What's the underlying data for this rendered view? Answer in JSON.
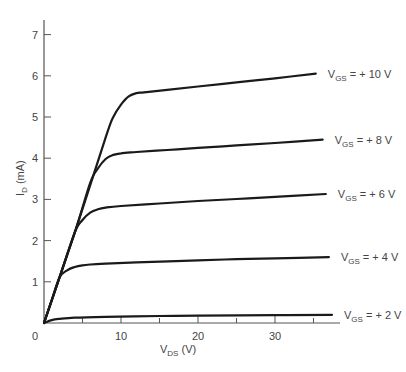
{
  "chart_data": {
    "type": "line",
    "title": "",
    "xlabel": "V_DS (V)",
    "xlabel_main": "V",
    "xlabel_sub": "DS",
    "xlabel_unit": "(V)",
    "ylabel": "I_D (mA)",
    "ylabel_main": "I",
    "ylabel_sub": "D",
    "ylabel_unit": "(mA)",
    "xlim": [
      0,
      42
    ],
    "ylim": [
      0,
      7.3
    ],
    "grid": false,
    "legend_position": "inline-right",
    "x_ticks_major": [
      10,
      20,
      30
    ],
    "x_ticks_minor": [
      5,
      15,
      25,
      35
    ],
    "x_tick_labels": [
      "0",
      "10",
      "20",
      "30"
    ],
    "y_ticks": [
      1,
      2,
      3,
      4,
      5,
      6,
      7
    ],
    "y_tick_labels": [
      "1",
      "2",
      "3",
      "4",
      "5",
      "6",
      "7"
    ],
    "origin_label": "0",
    "series": [
      {
        "name": "V_GS = + 10 V",
        "label_main": "V",
        "label_sub": "GS",
        "label_rest": " = + 10 V",
        "x": [
          0,
          4,
          8,
          9,
          10,
          11,
          12,
          13,
          16,
          20,
          25,
          30,
          35.3
        ],
        "y": [
          0,
          2.2,
          4.5,
          5.0,
          5.3,
          5.5,
          5.58,
          5.6,
          5.66,
          5.74,
          5.84,
          5.94,
          6.05
        ]
      },
      {
        "name": "V_GS = + 8 V",
        "label_main": "V",
        "label_sub": "GS",
        "label_rest": " = + 8 V",
        "x": [
          0,
          4,
          6,
          7,
          8,
          9,
          10,
          12,
          16,
          20,
          25,
          30,
          36.2
        ],
        "y": [
          0,
          2.2,
          3.4,
          3.75,
          3.98,
          4.08,
          4.12,
          4.15,
          4.2,
          4.25,
          4.31,
          4.37,
          4.45
        ]
      },
      {
        "name": "V_GS = + 6 V",
        "label_main": "V",
        "label_sub": "GS",
        "label_rest": " = + 6 V",
        "x": [
          0,
          2,
          4,
          5,
          6,
          7,
          8,
          10,
          15,
          20,
          25,
          30,
          36.6
        ],
        "y": [
          0,
          1.1,
          2.2,
          2.5,
          2.68,
          2.76,
          2.8,
          2.84,
          2.9,
          2.96,
          3.01,
          3.06,
          3.13
        ]
      },
      {
        "name": "V_GS = + 4 V",
        "label_main": "V",
        "label_sub": "GS",
        "label_rest": " = + 4 V",
        "x": [
          0,
          1,
          2,
          3,
          4,
          5,
          6,
          8,
          12,
          20,
          25,
          30,
          37
        ],
        "y": [
          0,
          0.55,
          1.1,
          1.28,
          1.36,
          1.4,
          1.42,
          1.44,
          1.47,
          1.52,
          1.55,
          1.57,
          1.6
        ]
      },
      {
        "name": "V_GS = + 2 V",
        "label_main": "V",
        "label_sub": "GS",
        "label_rest": " = + 2 V",
        "x": [
          0,
          1,
          2,
          4,
          8,
          15,
          20,
          30,
          37.4
        ],
        "y": [
          0,
          0.07,
          0.1,
          0.13,
          0.15,
          0.17,
          0.18,
          0.19,
          0.2
        ]
      }
    ],
    "layout": {
      "origin_px": [
        44,
        323
      ],
      "px_per_x": 7.7,
      "px_per_y": 41.2,
      "x_axis_end_px": 340,
      "y_axis_top_px": 20,
      "line_color": "#1a1a1a",
      "axis_color": "#555555"
    }
  }
}
